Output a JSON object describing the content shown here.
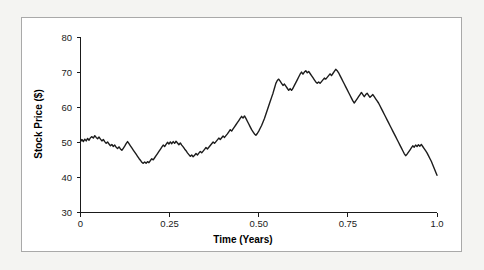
{
  "figure": {
    "background_color": "#f4f4f2",
    "card_color": "#ffffff",
    "border_color": "#a9a9a9"
  },
  "chart_data": {
    "type": "line",
    "title": "",
    "xlabel": "Time (Years)",
    "ylabel": "Stock Price ($)",
    "xlim": [
      0,
      1.0
    ],
    "ylim": [
      30,
      80
    ],
    "xticks": [
      0,
      0.25,
      0.5,
      0.75,
      1.0
    ],
    "xtick_labels": [
      "0",
      "0.25",
      "0.50",
      "0.75",
      "1.0"
    ],
    "yticks": [
      30,
      40,
      50,
      60,
      70,
      80
    ],
    "ytick_labels": [
      "30",
      "40",
      "50",
      "60",
      "70",
      "80"
    ],
    "grid": false,
    "legend": false,
    "line_color": "#1c1c1c",
    "line_width": 1.4,
    "series": [
      {
        "name": "Stock Price",
        "x": [
          0.0,
          0.004,
          0.008,
          0.012,
          0.016,
          0.02,
          0.024,
          0.028,
          0.032,
          0.036,
          0.04,
          0.044,
          0.048,
          0.052,
          0.056,
          0.06,
          0.064,
          0.068,
          0.072,
          0.076,
          0.08,
          0.084,
          0.088,
          0.092,
          0.096,
          0.1,
          0.104,
          0.108,
          0.112,
          0.116,
          0.12,
          0.124,
          0.128,
          0.132,
          0.136,
          0.14,
          0.144,
          0.148,
          0.152,
          0.156,
          0.16,
          0.164,
          0.168,
          0.172,
          0.176,
          0.18,
          0.184,
          0.188,
          0.192,
          0.196,
          0.2,
          0.204,
          0.208,
          0.212,
          0.216,
          0.22,
          0.224,
          0.228,
          0.232,
          0.236,
          0.24,
          0.244,
          0.248,
          0.252,
          0.256,
          0.26,
          0.264,
          0.268,
          0.272,
          0.276,
          0.28,
          0.284,
          0.288,
          0.292,
          0.296,
          0.3,
          0.304,
          0.308,
          0.312,
          0.316,
          0.32,
          0.324,
          0.328,
          0.332,
          0.336,
          0.34,
          0.344,
          0.348,
          0.352,
          0.356,
          0.36,
          0.364,
          0.368,
          0.372,
          0.376,
          0.38,
          0.384,
          0.388,
          0.392,
          0.396,
          0.4,
          0.404,
          0.408,
          0.412,
          0.416,
          0.42,
          0.424,
          0.428,
          0.432,
          0.436,
          0.44,
          0.444,
          0.448,
          0.452,
          0.456,
          0.46,
          0.464,
          0.468,
          0.472,
          0.476,
          0.48,
          0.484,
          0.488,
          0.492,
          0.496,
          0.5,
          0.504,
          0.508,
          0.512,
          0.516,
          0.52,
          0.524,
          0.528,
          0.532,
          0.536,
          0.54,
          0.544,
          0.548,
          0.552,
          0.556,
          0.56,
          0.564,
          0.568,
          0.572,
          0.576,
          0.58,
          0.584,
          0.588,
          0.592,
          0.596,
          0.6,
          0.604,
          0.608,
          0.612,
          0.616,
          0.62,
          0.624,
          0.628,
          0.632,
          0.636,
          0.64,
          0.644,
          0.648,
          0.652,
          0.656,
          0.66,
          0.664,
          0.668,
          0.672,
          0.676,
          0.68,
          0.684,
          0.688,
          0.692,
          0.696,
          0.7,
          0.704,
          0.708,
          0.712,
          0.716,
          0.72,
          0.724,
          0.728,
          0.732,
          0.736,
          0.74,
          0.744,
          0.748,
          0.752,
          0.756,
          0.76,
          0.764,
          0.768,
          0.772,
          0.776,
          0.78,
          0.784,
          0.788,
          0.792,
          0.796,
          0.8,
          0.804,
          0.808,
          0.812,
          0.816,
          0.82,
          0.824,
          0.828,
          0.832,
          0.836,
          0.84,
          0.844,
          0.848,
          0.852,
          0.856,
          0.86,
          0.864,
          0.868,
          0.872,
          0.876,
          0.88,
          0.884,
          0.888,
          0.892,
          0.896,
          0.9,
          0.904,
          0.908,
          0.912,
          0.916,
          0.92,
          0.924,
          0.928,
          0.932,
          0.936,
          0.94,
          0.944,
          0.948,
          0.952,
          0.956,
          0.96,
          0.964,
          0.968,
          0.972,
          0.976,
          0.98,
          0.984,
          0.988,
          0.992,
          0.996,
          1.0
        ],
        "values": [
          50.2,
          50.8,
          50.2,
          50.9,
          50.4,
          51.1,
          50.6,
          51.3,
          51.6,
          51.2,
          51.9,
          51.4,
          51.0,
          51.5,
          50.9,
          50.4,
          50.8,
          50.2,
          49.7,
          50.1,
          49.5,
          49.0,
          49.4,
          48.8,
          49.2,
          48.6,
          48.2,
          48.7,
          48.1,
          47.7,
          48.3,
          48.9,
          49.6,
          50.2,
          49.6,
          49.0,
          48.4,
          47.8,
          47.2,
          46.6,
          46.0,
          45.4,
          44.9,
          44.3,
          44.0,
          44.4,
          44.0,
          44.5,
          44.2,
          44.8,
          45.3,
          45.0,
          45.6,
          46.2,
          46.8,
          47.4,
          48.0,
          48.6,
          49.2,
          48.8,
          49.4,
          50.0,
          49.5,
          50.1,
          49.6,
          50.2,
          49.7,
          50.3,
          49.8,
          49.3,
          49.8,
          49.2,
          48.7,
          48.1,
          47.6,
          47.0,
          46.5,
          46.0,
          46.4,
          45.9,
          46.3,
          46.8,
          46.4,
          46.9,
          47.4,
          47.0,
          47.5,
          48.0,
          48.5,
          48.1,
          48.6,
          49.1,
          49.6,
          50.1,
          49.7,
          50.2,
          50.7,
          51.2,
          50.8,
          51.3,
          51.8,
          51.4,
          51.9,
          52.4,
          53.0,
          53.6,
          53.2,
          53.8,
          54.4,
          55.0,
          55.6,
          56.2,
          56.8,
          57.4,
          56.9,
          57.5,
          56.8,
          56.0,
          55.2,
          54.4,
          53.6,
          53.0,
          52.4,
          52.0,
          52.5,
          53.2,
          54.0,
          54.8,
          55.8,
          56.8,
          58.0,
          59.2,
          60.4,
          61.6,
          62.8,
          64.0,
          65.4,
          66.8,
          67.6,
          68.0,
          67.4,
          66.8,
          66.2,
          66.6,
          66.0,
          65.4,
          64.8,
          65.3,
          64.8,
          65.4,
          66.2,
          67.0,
          67.8,
          68.6,
          69.4,
          70.0,
          69.4,
          70.0,
          70.4,
          69.8,
          70.2,
          69.6,
          69.0,
          68.4,
          67.8,
          67.2,
          66.8,
          67.2,
          66.8,
          67.3,
          67.8,
          68.3,
          68.0,
          68.5,
          69.0,
          69.5,
          69.0,
          69.6,
          70.2,
          70.8,
          70.4,
          69.8,
          69.0,
          68.2,
          67.4,
          66.6,
          65.8,
          65.0,
          64.2,
          63.4,
          62.6,
          61.8,
          61.2,
          61.8,
          62.4,
          63.0,
          63.6,
          64.2,
          63.6,
          63.0,
          63.6,
          64.0,
          63.4,
          62.8,
          63.2,
          63.6,
          63.0,
          62.4,
          61.8,
          61.2,
          60.4,
          59.6,
          58.8,
          58.0,
          57.2,
          56.4,
          55.6,
          54.8,
          54.0,
          53.2,
          52.4,
          51.6,
          50.8,
          50.0,
          49.2,
          48.4,
          47.6,
          46.8,
          46.2,
          46.6,
          47.2,
          47.8,
          48.4,
          49.0,
          48.6,
          49.2,
          48.8,
          49.3,
          48.9,
          49.4,
          48.8,
          48.2,
          47.6,
          47.0,
          46.2,
          45.4,
          44.6,
          43.6,
          42.6,
          41.6,
          40.6
        ]
      }
    ]
  },
  "axis": {
    "y_title": "Stock Price ($)",
    "x_title": "Time (Years)"
  }
}
